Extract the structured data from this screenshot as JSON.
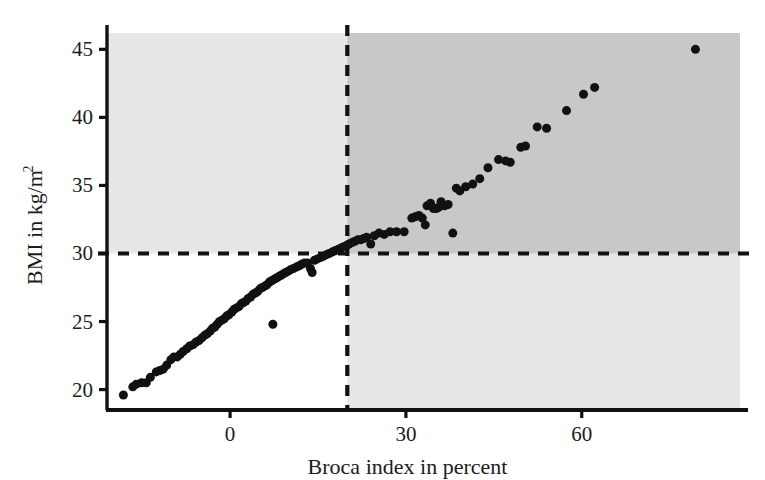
{
  "chart_data": {
    "type": "scatter",
    "title": "",
    "xlabel": "Broca index in percent",
    "ylabel": "BMI in kg/m",
    "ylabel_exponent": "2",
    "xlim": [
      -21,
      87
    ],
    "ylim": [
      18.5,
      46.2
    ],
    "xticks": [
      0,
      30,
      60
    ],
    "xticklabels": [
      "0",
      "30",
      "60"
    ],
    "yticks": [
      20,
      25,
      30,
      35,
      40,
      45
    ],
    "yticklabels": [
      "20",
      "25",
      "30",
      "35",
      "40",
      "45"
    ],
    "grid": false,
    "legend": null,
    "marker": "filled-circle",
    "marker_color": "#111111",
    "marker_size_px": 9,
    "reference_lines": [
      {
        "name": "bmi-obesity-threshold",
        "orientation": "horizontal",
        "value": 30,
        "style": "dashed",
        "color": "#111111"
      },
      {
        "name": "broca-obesity-threshold",
        "orientation": "vertical",
        "value": 20,
        "style": "dashed",
        "color": "#111111"
      }
    ],
    "shaded_regions": [
      {
        "name": "bmi-above-30-band",
        "x_range": [
          -21,
          87
        ],
        "y_range": [
          30,
          46.2
        ],
        "color": "#e7e7e7"
      },
      {
        "name": "broca-above-20-band",
        "x_range": [
          20,
          87
        ],
        "y_range": [
          18.5,
          46.2
        ],
        "color": "#e7e7e7"
      },
      {
        "name": "both-obese-overlap",
        "x_range": [
          20,
          87
        ],
        "y_range": [
          30,
          46.2
        ],
        "color": "#c8c8c8"
      }
    ],
    "points": [
      [
        -18.2,
        19.6
      ],
      [
        -16.6,
        20.2
      ],
      [
        -16.0,
        20.4
      ],
      [
        -15.1,
        20.5
      ],
      [
        -14.3,
        20.5
      ],
      [
        -13.6,
        20.9
      ],
      [
        -12.6,
        21.3
      ],
      [
        -12.0,
        21.4
      ],
      [
        -11.4,
        21.5
      ],
      [
        -10.8,
        21.8
      ],
      [
        -10.1,
        22.2
      ],
      [
        -9.6,
        22.4
      ],
      [
        -9.0,
        22.4
      ],
      [
        -8.5,
        22.6
      ],
      [
        -8.0,
        22.8
      ],
      [
        -7.4,
        23.0
      ],
      [
        -6.9,
        23.2
      ],
      [
        -6.3,
        23.3
      ],
      [
        -5.8,
        23.5
      ],
      [
        -5.3,
        23.6
      ],
      [
        -4.8,
        23.8
      ],
      [
        -4.3,
        24.0
      ],
      [
        -3.9,
        24.1
      ],
      [
        -3.4,
        24.3
      ],
      [
        -3.0,
        24.5
      ],
      [
        -2.6,
        24.6
      ],
      [
        -2.2,
        24.8
      ],
      [
        -1.8,
        25.0
      ],
      [
        -1.4,
        25.1
      ],
      [
        -1.0,
        25.2
      ],
      [
        -0.6,
        25.4
      ],
      [
        -0.2,
        25.5
      ],
      [
        0.3,
        25.7
      ],
      [
        0.7,
        25.9
      ],
      [
        1.1,
        26.0
      ],
      [
        1.5,
        26.1
      ],
      [
        1.9,
        26.3
      ],
      [
        2.3,
        26.4
      ],
      [
        2.7,
        26.5
      ],
      [
        3.1,
        26.7
      ],
      [
        3.5,
        26.8
      ],
      [
        3.9,
        27.0
      ],
      [
        4.3,
        27.1
      ],
      [
        4.7,
        27.2
      ],
      [
        5.1,
        27.4
      ],
      [
        5.5,
        27.5
      ],
      [
        5.9,
        27.6
      ],
      [
        6.3,
        27.7
      ],
      [
        6.7,
        27.9
      ],
      [
        7.1,
        28.0
      ],
      [
        7.5,
        28.1
      ],
      [
        7.9,
        28.2
      ],
      [
        8.3,
        28.3
      ],
      [
        8.7,
        28.4
      ],
      [
        9.1,
        28.5
      ],
      [
        9.5,
        28.6
      ],
      [
        9.9,
        28.7
      ],
      [
        10.3,
        28.8
      ],
      [
        10.8,
        28.9
      ],
      [
        11.3,
        29.0
      ],
      [
        11.8,
        29.1
      ],
      [
        12.2,
        29.2
      ],
      [
        12.7,
        29.3
      ],
      [
        13.2,
        29.3
      ],
      [
        13.7,
        28.9
      ],
      [
        14.0,
        28.6
      ],
      [
        14.4,
        29.5
      ],
      [
        14.9,
        29.6
      ],
      [
        15.4,
        29.7
      ],
      [
        15.9,
        29.8
      ],
      [
        16.4,
        29.9
      ],
      [
        16.9,
        30.0
      ],
      [
        17.4,
        30.1
      ],
      [
        17.9,
        30.2
      ],
      [
        18.4,
        30.3
      ],
      [
        18.9,
        30.4
      ],
      [
        19.4,
        30.5
      ],
      [
        19.9,
        30.6
      ],
      [
        20.3,
        30.7
      ],
      [
        20.8,
        30.8
      ],
      [
        21.3,
        30.9
      ],
      [
        21.8,
        31.0
      ],
      [
        22.3,
        31.0
      ],
      [
        22.8,
        31.1
      ],
      [
        23.3,
        31.2
      ],
      [
        7.3,
        24.8
      ],
      [
        24.0,
        30.7
      ],
      [
        24.6,
        31.3
      ],
      [
        25.4,
        31.5
      ],
      [
        26.3,
        31.4
      ],
      [
        27.3,
        31.6
      ],
      [
        28.4,
        31.6
      ],
      [
        29.7,
        31.6
      ],
      [
        31.0,
        32.6
      ],
      [
        31.6,
        32.7
      ],
      [
        32.2,
        32.8
      ],
      [
        32.8,
        32.6
      ],
      [
        33.3,
        32.1
      ],
      [
        33.6,
        33.5
      ],
      [
        34.2,
        33.7
      ],
      [
        34.7,
        33.3
      ],
      [
        35.2,
        33.3
      ],
      [
        35.6,
        33.4
      ],
      [
        36.0,
        33.8
      ],
      [
        36.6,
        33.5
      ],
      [
        37.2,
        33.6
      ],
      [
        38.0,
        31.5
      ],
      [
        38.6,
        34.8
      ],
      [
        39.2,
        34.6
      ],
      [
        40.2,
        34.9
      ],
      [
        41.4,
        35.1
      ],
      [
        42.6,
        35.5
      ],
      [
        44.0,
        36.3
      ],
      [
        45.8,
        36.9
      ],
      [
        47.0,
        36.8
      ],
      [
        47.8,
        36.7
      ],
      [
        49.6,
        37.8
      ],
      [
        50.4,
        37.9
      ],
      [
        52.4,
        39.3
      ],
      [
        54.0,
        39.2
      ],
      [
        57.4,
        40.5
      ],
      [
        60.3,
        41.7
      ],
      [
        62.2,
        42.2
      ],
      [
        79.4,
        45.0
      ]
    ]
  },
  "figure": {
    "background_color": "#ffffff",
    "axis_color": "#111111"
  }
}
